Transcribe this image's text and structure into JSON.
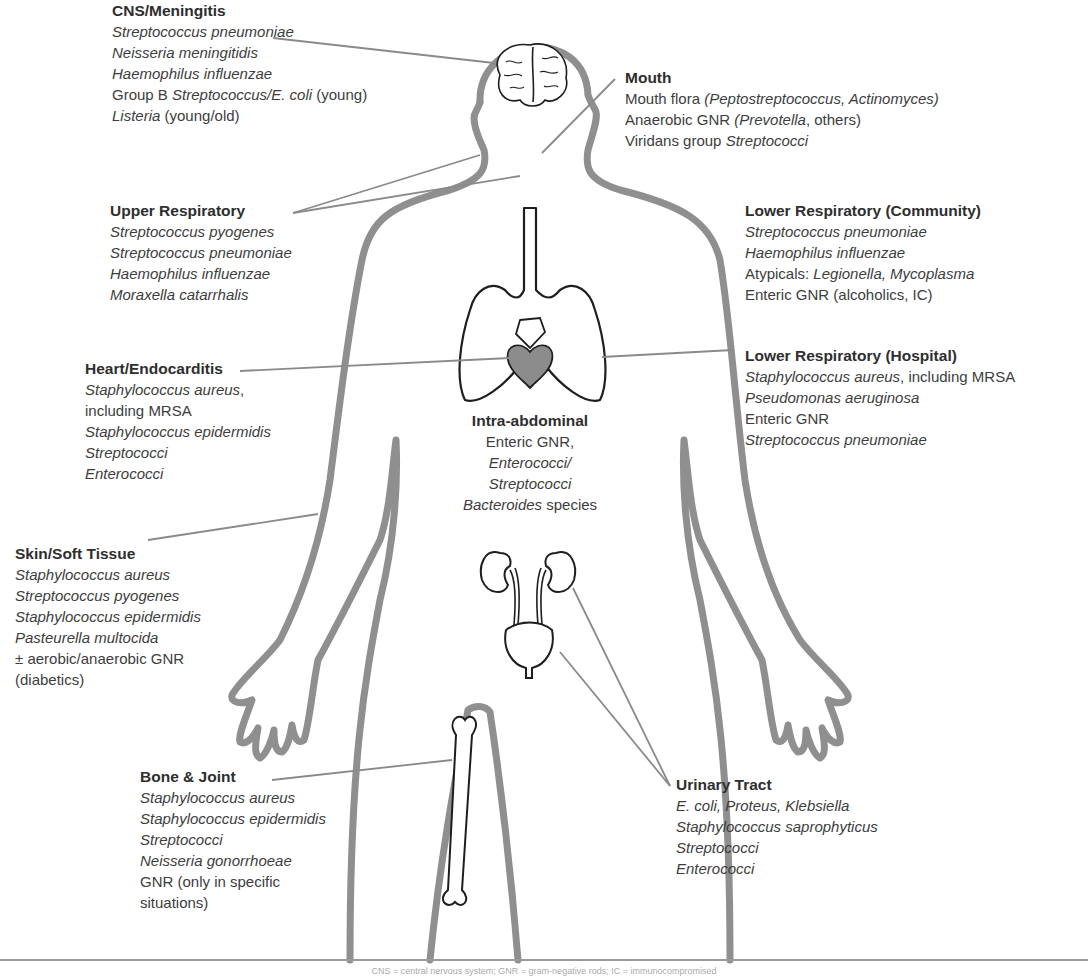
{
  "colors": {
    "body_outline": "#8f8f8f",
    "leader_line": "#8a8a8a",
    "organ_outline": "#1e1e1e",
    "heart_fill": "#8c8c8c",
    "text": "#3d3d3d",
    "baseline": "#9a9a9a"
  },
  "sites": [
    {
      "id": "cns",
      "title": "CNS/Meningitis",
      "lines": [
        [
          {
            "t": "Streptococcus pneumoniae",
            "i": true
          }
        ],
        [
          {
            "t": "Neisseria meningitidis",
            "i": true
          }
        ],
        [
          {
            "t": "Haemophilus influenzae",
            "i": true
          }
        ],
        [
          {
            "t": "Group B ",
            "i": false
          },
          {
            "t": "Streptococcus/E. coli",
            "i": true
          },
          {
            "t": " (young)",
            "i": false
          }
        ],
        [
          {
            "t": "Listeria",
            "i": true
          },
          {
            "t": " (young/old)",
            "i": false
          }
        ]
      ]
    },
    {
      "id": "mouth",
      "title": "Mouth",
      "lines": [
        [
          {
            "t": "Mouth flora ",
            "i": false
          },
          {
            "t": "(Peptostreptococcus, Actinomyces)",
            "i": true
          }
        ],
        [
          {
            "t": "Anaerobic GNR ",
            "i": false
          },
          {
            "t": "(Prevotella",
            "i": true
          },
          {
            "t": ", others)",
            "i": false
          }
        ],
        [
          {
            "t": "Viridans group ",
            "i": false
          },
          {
            "t": "Streptococci",
            "i": true
          }
        ]
      ]
    },
    {
      "id": "upper-respiratory",
      "title": "Upper Respiratory",
      "lines": [
        [
          {
            "t": "Streptococcus pyogenes",
            "i": true
          }
        ],
        [
          {
            "t": "Streptococcus pneumoniae",
            "i": true
          }
        ],
        [
          {
            "t": "Haemophilus influenzae",
            "i": true
          }
        ],
        [
          {
            "t": "Moraxella catarrhalis",
            "i": true
          }
        ]
      ]
    },
    {
      "id": "lower-respiratory-community",
      "title": "Lower Respiratory (Community)",
      "lines": [
        [
          {
            "t": "Streptococcus pneumoniae",
            "i": true
          }
        ],
        [
          {
            "t": "Haemophilus influenzae",
            "i": true
          }
        ],
        [
          {
            "t": "Atypicals: ",
            "i": false
          },
          {
            "t": "Legionella, Mycoplasma",
            "i": true
          }
        ],
        [
          {
            "t": "Enteric GNR (alcoholics, IC)",
            "i": false
          }
        ]
      ]
    },
    {
      "id": "heart",
      "title": "Heart/Endocarditis",
      "lines": [
        [
          {
            "t": "Staphylococcus aureus",
            "i": true
          },
          {
            "t": ",",
            "i": false
          }
        ],
        [
          {
            "t": "including MRSA",
            "i": false
          }
        ],
        [
          {
            "t": "Staphylococcus epidermidis",
            "i": true
          }
        ],
        [
          {
            "t": "Streptococci",
            "i": true
          }
        ],
        [
          {
            "t": "Enterococci",
            "i": true
          }
        ]
      ]
    },
    {
      "id": "lower-respiratory-hospital",
      "title": "Lower Respiratory (Hospital)",
      "lines": [
        [
          {
            "t": "Staphylococcus aureus",
            "i": true
          },
          {
            "t": ", including MRSA",
            "i": false
          }
        ],
        [
          {
            "t": "Pseudomonas aeruginosa",
            "i": true
          }
        ],
        [
          {
            "t": "Enteric GNR",
            "i": false
          }
        ],
        [
          {
            "t": "Streptococcus pneumoniae",
            "i": true
          }
        ]
      ]
    },
    {
      "id": "intra-abdominal",
      "title": "Intra-abdominal",
      "lines": [
        [
          {
            "t": "Enteric GNR,",
            "i": false
          }
        ],
        [
          {
            "t": "Enterococci/",
            "i": true
          }
        ],
        [
          {
            "t": "Streptococci",
            "i": true
          }
        ],
        [
          {
            "t": "Bacteroides",
            "i": true
          },
          {
            "t": " species",
            "i": false
          }
        ]
      ]
    },
    {
      "id": "skin",
      "title": "Skin/Soft Tissue",
      "lines": [
        [
          {
            "t": "Staphylococcus aureus",
            "i": true
          }
        ],
        [
          {
            "t": "Streptococcus pyogenes",
            "i": true
          }
        ],
        [
          {
            "t": "Staphylococcus epidermidis",
            "i": true
          }
        ],
        [
          {
            "t": "Pasteurella multocida",
            "i": true
          }
        ],
        [
          {
            "t": "± aerobic/anaerobic GNR",
            "i": false
          }
        ],
        [
          {
            "t": "(diabetics)",
            "i": false
          }
        ]
      ]
    },
    {
      "id": "bone",
      "title": "Bone & Joint",
      "lines": [
        [
          {
            "t": "Staphylococcus aureus",
            "i": true
          }
        ],
        [
          {
            "t": "Staphylococcus epidermidis",
            "i": true
          }
        ],
        [
          {
            "t": "Streptococci",
            "i": true
          }
        ],
        [
          {
            "t": "Neisseria gonorrhoeae",
            "i": true
          }
        ],
        [
          {
            "t": "GNR (only in specific",
            "i": false
          }
        ],
        [
          {
            "t": "situations)",
            "i": false
          }
        ]
      ]
    },
    {
      "id": "urinary",
      "title": "Urinary Tract",
      "lines": [
        [
          {
            "t": "E. coli, Proteus, Klebsiella",
            "i": true
          }
        ],
        [
          {
            "t": "Staphylococcus saprophyticus",
            "i": true
          }
        ],
        [
          {
            "t": "Streptococci",
            "i": true
          }
        ],
        [
          {
            "t": "Enterococci",
            "i": true
          }
        ]
      ]
    }
  ],
  "icons": [
    "brain-icon",
    "trachea-lungs-icon",
    "heart-icon",
    "kidneys-icon",
    "bladder-icon",
    "bone-icon",
    "body-outline-icon"
  ],
  "caption": "CNS = central nervous system; GNR = gram-negative rods; IC = immunocompromised"
}
